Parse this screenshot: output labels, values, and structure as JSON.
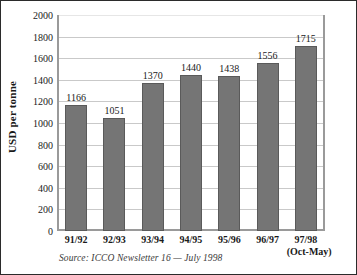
{
  "figure": {
    "source_note": "Source: ICCO Newsletter 16 — July 1998",
    "frame_color": "#2b2b2b",
    "bar_color": "#757575",
    "bar_border_color": "#5a5a5a",
    "gridline_color": "#c9c9c9",
    "axis_color": "#9a9a9a"
  },
  "chart_data": {
    "type": "bar",
    "title": "",
    "xlabel": "",
    "ylabel": "USD per tonne",
    "ylim": [
      0,
      2000
    ],
    "yticks": [
      0,
      200,
      400,
      600,
      800,
      1000,
      1200,
      1400,
      1600,
      1800,
      2000
    ],
    "ytick_labels": [
      "0",
      "200",
      "400",
      "600",
      "800",
      "1000",
      "1200",
      "1400",
      "1600",
      "1800",
      "2000"
    ],
    "grid": true,
    "legend": null,
    "categories": [
      "91/92",
      "92/93",
      "93/94",
      "94/95",
      "95/96",
      "96/97",
      "97/98"
    ],
    "category_sublabels": [
      "",
      "",
      "",
      "",
      "",
      "",
      "(Oct-May)"
    ],
    "values": [
      1166,
      1051,
      1370,
      1440,
      1438,
      1556,
      1715
    ],
    "value_labels": [
      "1166",
      "1051",
      "1370",
      "1440",
      "1438",
      "1556",
      "1715"
    ],
    "annotations": [
      "Source: ICCO Newsletter 16 — July 1998"
    ]
  }
}
